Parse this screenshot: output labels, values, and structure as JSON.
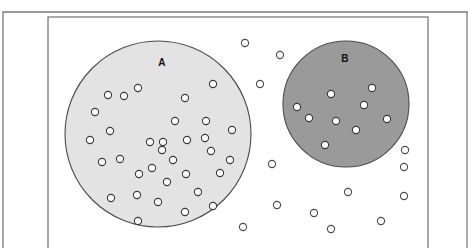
{
  "figure": {
    "width": 468,
    "height": 248,
    "background_color": "#ffffff"
  },
  "frame": {
    "outer_border": {
      "name": "outer-frame-rule",
      "x": 3,
      "y": 12,
      "width": 464,
      "height": 244,
      "stroke_color": "#6e6e6e",
      "stroke_width": 1.2,
      "fill": "none"
    },
    "inner_border": {
      "name": "inner-frame-rule",
      "x": 48,
      "y": 17,
      "width": 380,
      "height": 239,
      "stroke_color": "#6e6e6e",
      "stroke_width": 1.2,
      "fill": "none"
    },
    "top_rule": {
      "name": "top-edge-rule",
      "x1": 3,
      "y1": 12,
      "x2": 468,
      "y2": 12,
      "stroke_color": "#8a8a8a",
      "stroke_width": 1
    }
  },
  "regions": [
    {
      "id": "region-a",
      "label": "A",
      "cx": 158,
      "cy": 134,
      "r": 93,
      "fill_color": "#e3e3e3",
      "stroke_color": "#4a4a4a",
      "stroke_width": 1.1,
      "label_x": 162,
      "label_y": 63,
      "dot_count": 33
    },
    {
      "id": "region-b",
      "label": "B",
      "cx": 346,
      "cy": 104,
      "r": 63,
      "fill_color": "#9a9a9a",
      "stroke_color": "#4a4a4a",
      "stroke_width": 1.1,
      "label_x": 345,
      "label_y": 59,
      "dot_count": 9
    }
  ],
  "dot_style": {
    "radius": 3.6,
    "inside_fill": "#ffffff",
    "inside_stroke": "#3a3a3a",
    "outside_fill": "#ffffff",
    "outside_stroke": "#4a4a4a",
    "stroke_width": 1.1
  },
  "chart_data": {
    "type": "scatter",
    "xlabel": "",
    "ylabel": "",
    "xlim": [
      0,
      468
    ],
    "ylim": [
      248,
      0
    ],
    "grid": false,
    "legend": null,
    "annotations": [
      {
        "text": "A",
        "x": 162,
        "y": 63
      },
      {
        "text": "B",
        "x": 345,
        "y": 59
      }
    ],
    "series": [
      {
        "name": "dots-in-region-a",
        "marker": "open-circle",
        "count": 33,
        "points": [
          [
            108,
            95
          ],
          [
            138,
            88
          ],
          [
            95,
            112
          ],
          [
            110,
            131
          ],
          [
            90,
            140
          ],
          [
            150,
            142
          ],
          [
            185,
            98
          ],
          [
            213,
            84
          ],
          [
            175,
            121
          ],
          [
            206,
            121
          ],
          [
            232,
            130
          ],
          [
            187,
            140
          ],
          [
            102,
            162
          ],
          [
            120,
            159
          ],
          [
            139,
            174
          ],
          [
            111,
            198
          ],
          [
            137,
            195
          ],
          [
            158,
            202
          ],
          [
            138,
            221
          ],
          [
            163,
            142
          ],
          [
            162,
            150
          ],
          [
            211,
            151
          ],
          [
            186,
            174
          ],
          [
            220,
            173
          ],
          [
            167,
            182
          ],
          [
            198,
            192
          ],
          [
            185,
            212
          ],
          [
            213,
            206
          ],
          [
            124,
            96
          ],
          [
            173,
            160
          ],
          [
            152,
            168
          ],
          [
            205,
            138
          ],
          [
            230,
            160
          ]
        ]
      },
      {
        "name": "dots-in-region-b",
        "marker": "filled-white-circle",
        "count": 9,
        "points": [
          [
            331,
            94
          ],
          [
            372,
            88
          ],
          [
            364,
            105
          ],
          [
            297,
            107
          ],
          [
            309,
            118
          ],
          [
            336,
            121
          ],
          [
            356,
            130
          ],
          [
            387,
            119
          ],
          [
            325,
            145
          ]
        ]
      },
      {
        "name": "dots-outside-regions",
        "marker": "open-circle",
        "count": 13,
        "points": [
          [
            245,
            43
          ],
          [
            280,
            55
          ],
          [
            260,
            84
          ],
          [
            272,
            164
          ],
          [
            404,
            167
          ],
          [
            348,
            192
          ],
          [
            277,
            205
          ],
          [
            314,
            213
          ],
          [
            404,
            196
          ],
          [
            405,
            150
          ],
          [
            243,
            227
          ],
          [
            331,
            229
          ],
          [
            381,
            221
          ]
        ]
      }
    ]
  }
}
